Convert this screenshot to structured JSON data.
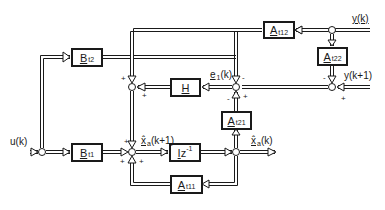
{
  "diagram": {
    "type": "block-diagram",
    "signals": {
      "y_k": "y(k)",
      "y_k1": "y(k+1)",
      "u_k": "u(k)",
      "e1_k": "e",
      "e1_sub": "1",
      "e1_arg": "(k)",
      "xhat_k1": "x̂",
      "xhat_k1_sub": "a",
      "xhat_k1_arg": "(k+1)",
      "xhat_k": "x̂",
      "xhat_k_sub": "a",
      "xhat_k_arg": "(k)"
    },
    "blocks": {
      "A_t12": {
        "sym": "A",
        "sub": "t12"
      },
      "A_t22": {
        "sym": "A",
        "sub": "t22"
      },
      "B_t2": {
        "sym": "B",
        "sub": "t2"
      },
      "H": {
        "sym": "H",
        "sub": ""
      },
      "A_t21": {
        "sym": "A",
        "sub": "t21"
      },
      "B_t1": {
        "sym": "B",
        "sub": "t1"
      },
      "Iz": {
        "sym": "I",
        "rest": "z",
        "sup": "-1"
      },
      "A_t11": {
        "sym": "A",
        "sub": "t11"
      }
    },
    "signs": {
      "plus": "+",
      "minus": "-"
    }
  }
}
